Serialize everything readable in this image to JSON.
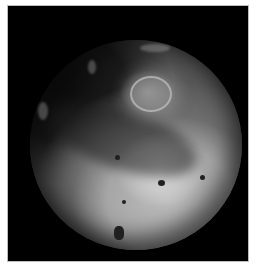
{
  "image": {
    "subject": "planetary moon (Io-like) on black background",
    "style": "grayscale photograph",
    "colors": {
      "background": "#000000",
      "margin": "#ffffff",
      "border": "#bdbdbd",
      "surface_light": "#c8c8c8",
      "surface_dark": "#1e1e1e"
    }
  }
}
